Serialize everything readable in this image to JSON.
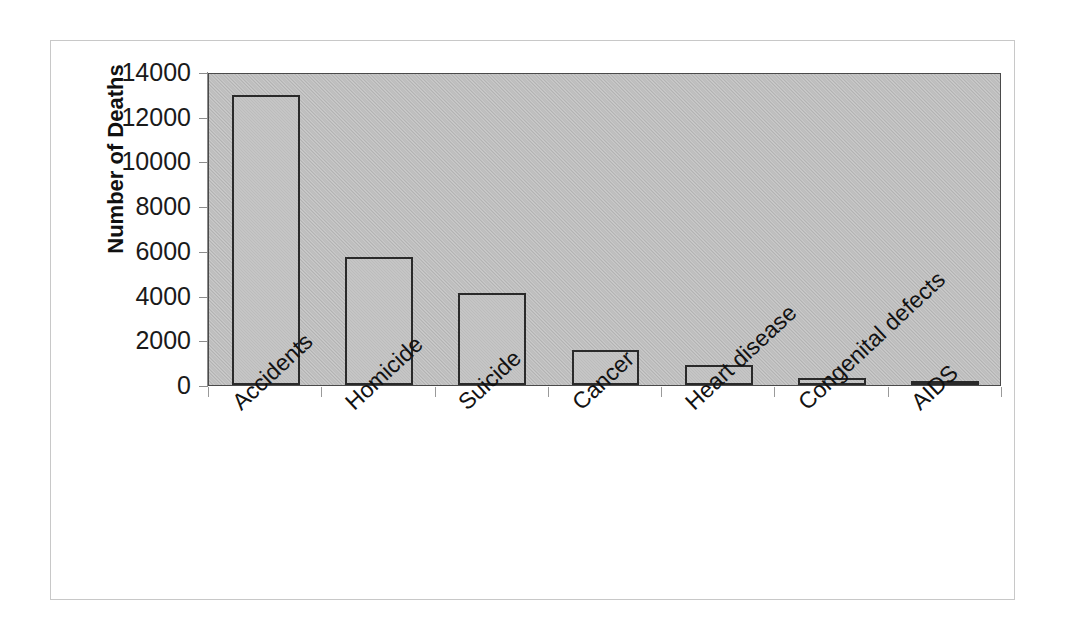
{
  "chart_data": {
    "type": "bar",
    "title": "",
    "subtitle": "",
    "xlabel": "",
    "ylabel": "Number of Deaths",
    "categories": [
      "Accidents",
      "Homicide",
      "Suicide",
      "Cancer",
      "Heart disease",
      "Congenital defects",
      "AIDS"
    ],
    "values": [
      12950,
      5730,
      4130,
      1550,
      880,
      300,
      190
    ],
    "ylim": [
      0,
      14000
    ],
    "ytick_labels": [
      "14000",
      "12000",
      "10000",
      "8000",
      "6000",
      "4000",
      "2000",
      "0"
    ],
    "ytick_values": [
      14000,
      12000,
      10000,
      8000,
      6000,
      4000,
      2000,
      0
    ],
    "ytick_step": 2000,
    "grid": false,
    "legend": null,
    "legend_position": "none",
    "annotations": [],
    "xtick_label_rotation": -43,
    "colors": {
      "bar_fill": "#bcbcbc",
      "bar_outline": "#2a2a2a",
      "plot_background": "#bdbdbd",
      "axis": "#8c8c8c",
      "text": "#1a1a1a",
      "frame_border": "#c8c8c8",
      "page_background": "#ffffff"
    }
  }
}
